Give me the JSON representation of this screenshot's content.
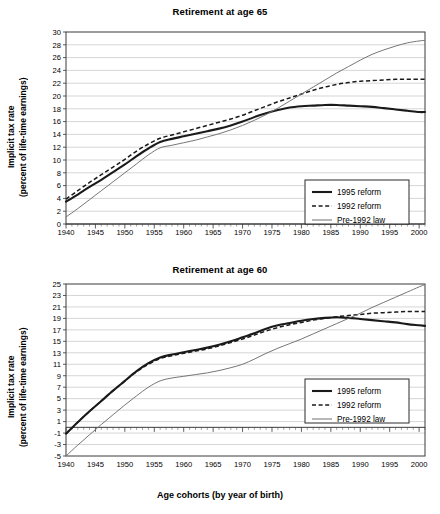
{
  "figure": {
    "xaxis_title": "Age cohorts (by year of birth)",
    "shared_ylabel_line1": "Implicit tax rate",
    "shared_ylabel_line2": "(percent of life-time earnings)"
  },
  "legend": {
    "items": [
      {
        "label": "1995 reform",
        "style": "solid-thick",
        "color": "#1a1a1a"
      },
      {
        "label": "1992 reform",
        "style": "dashed",
        "color": "#1a1a1a"
      },
      {
        "label": "Pre-1992 law",
        "style": "solid-thin",
        "color": "#6f6f6f"
      }
    ]
  },
  "chart_data": [
    {
      "id": "retirement-65",
      "type": "line",
      "title": "Retirement at age 65",
      "xlabel": "Age cohorts (by year of birth)",
      "ylabel": "Implicit tax rate (percent of life-time earnings)",
      "xlim": [
        1940,
        2001
      ],
      "ylim": [
        0,
        30
      ],
      "xticks": [
        1940,
        1945,
        1950,
        1955,
        1960,
        1965,
        1970,
        1975,
        1980,
        1985,
        1990,
        1995,
        2000
      ],
      "yticks": [
        0,
        2,
        4,
        6,
        8,
        10,
        12,
        14,
        16,
        18,
        20,
        22,
        24,
        26,
        28,
        30
      ],
      "grid": "horizontal",
      "minor_xtick_step": 1,
      "legend_position": "bottom-right",
      "x": [
        1940,
        1942,
        1944,
        1946,
        1948,
        1950,
        1952,
        1954,
        1956,
        1958,
        1960,
        1962,
        1964,
        1966,
        1968,
        1970,
        1972,
        1974,
        1976,
        1978,
        1980,
        1982,
        1984,
        1986,
        1988,
        1990,
        1992,
        1994,
        1996,
        1998,
        2000,
        2001
      ],
      "series": [
        {
          "name": "1995 reform",
          "values": [
            3.5,
            4.6,
            5.8,
            6.9,
            8.1,
            9.3,
            10.6,
            11.8,
            12.8,
            13.3,
            13.7,
            14.1,
            14.5,
            14.9,
            15.4,
            16.0,
            16.7,
            17.3,
            17.8,
            18.2,
            18.4,
            18.5,
            18.6,
            18.6,
            18.5,
            18.4,
            18.3,
            18.1,
            17.9,
            17.7,
            17.5,
            17.5
          ]
        },
        {
          "name": "1992 reform",
          "values": [
            3.9,
            5.2,
            6.5,
            7.7,
            8.9,
            10.1,
            11.4,
            12.5,
            13.4,
            13.9,
            14.4,
            14.9,
            15.4,
            15.9,
            16.4,
            17.0,
            17.7,
            18.4,
            19.1,
            19.7,
            20.3,
            20.9,
            21.4,
            21.8,
            22.1,
            22.3,
            22.4,
            22.5,
            22.6,
            22.6,
            22.6,
            22.6
          ]
        },
        {
          "name": "Pre-1992 law",
          "values": [
            1.1,
            2.4,
            3.8,
            5.2,
            6.6,
            8.0,
            9.4,
            10.8,
            11.9,
            12.3,
            12.7,
            13.1,
            13.6,
            14.1,
            14.7,
            15.4,
            16.2,
            17.1,
            18.1,
            19.2,
            20.3,
            21.4,
            22.5,
            23.6,
            24.6,
            25.6,
            26.5,
            27.2,
            27.8,
            28.3,
            28.6,
            28.7
          ]
        }
      ]
    },
    {
      "id": "retirement-60",
      "type": "line",
      "title": "Retirement at age 60",
      "xlabel": "Age cohorts (by year of birth)",
      "ylabel": "Implicit tax rate (percent of life-time earnings)",
      "xlim": [
        1940,
        2001
      ],
      "ylim": [
        -5,
        25
      ],
      "xticks": [
        1940,
        1945,
        1950,
        1955,
        1960,
        1965,
        1970,
        1975,
        1980,
        1985,
        1990,
        1995,
        2000
      ],
      "yticks": [
        -5,
        -3,
        -1,
        1,
        3,
        5,
        7,
        9,
        11,
        13,
        15,
        17,
        19,
        21,
        23,
        25
      ],
      "grid": "horizontal",
      "minor_xtick_step": 1,
      "zero_axis": 0,
      "legend_position": "right-middle",
      "x": [
        1940,
        1942,
        1944,
        1946,
        1948,
        1950,
        1952,
        1954,
        1956,
        1958,
        1960,
        1962,
        1964,
        1966,
        1968,
        1970,
        1972,
        1974,
        1976,
        1978,
        1980,
        1982,
        1984,
        1986,
        1988,
        1990,
        1992,
        1994,
        1996,
        1998,
        2000,
        2001
      ],
      "series": [
        {
          "name": "1995 reform",
          "values": [
            -1.1,
            0.9,
            2.8,
            4.6,
            6.4,
            8.1,
            9.8,
            11.2,
            12.2,
            12.7,
            13.1,
            13.5,
            13.9,
            14.4,
            15.0,
            15.7,
            16.4,
            17.2,
            17.8,
            18.2,
            18.6,
            18.9,
            19.1,
            19.2,
            19.1,
            18.9,
            18.7,
            18.5,
            18.3,
            18.0,
            17.8,
            17.7
          ]
        },
        {
          "name": "1992 reform",
          "values": [
            -1.1,
            0.9,
            2.8,
            4.6,
            6.4,
            8.1,
            9.7,
            11.0,
            12.0,
            12.5,
            12.9,
            13.3,
            13.7,
            14.2,
            14.8,
            15.4,
            16.1,
            16.8,
            17.4,
            17.9,
            18.3,
            18.7,
            19.0,
            19.3,
            19.5,
            19.7,
            19.9,
            20.0,
            20.1,
            20.2,
            20.2,
            20.2
          ]
        },
        {
          "name": "Pre-1992 law",
          "values": [
            -5.0,
            -3.1,
            -1.3,
            0.5,
            2.2,
            3.9,
            5.5,
            7.0,
            8.1,
            8.6,
            8.9,
            9.2,
            9.5,
            9.9,
            10.4,
            11.0,
            11.9,
            12.9,
            13.8,
            14.6,
            15.4,
            16.3,
            17.2,
            18.1,
            19.0,
            19.9,
            20.9,
            21.8,
            22.7,
            23.6,
            24.5,
            24.9
          ]
        }
      ]
    }
  ]
}
